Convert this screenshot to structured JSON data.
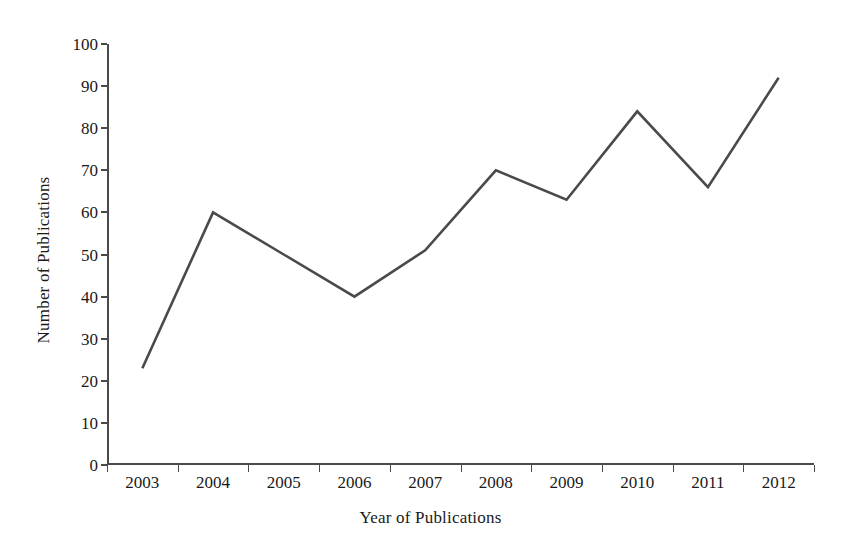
{
  "chart_data": {
    "type": "line",
    "title": "",
    "xlabel": "Year of Publications",
    "ylabel": "Number of Publications",
    "categories": [
      "2003",
      "2004",
      "2005",
      "2006",
      "2007",
      "2008",
      "2009",
      "2010",
      "2011",
      "2012"
    ],
    "values": [
      23,
      60,
      50,
      40,
      51,
      70,
      63,
      84,
      66,
      92
    ],
    "series": [
      {
        "name": "Number of Publications",
        "values": [
          23,
          60,
          50,
          40,
          51,
          70,
          63,
          84,
          66,
          92
        ]
      }
    ],
    "ylim": [
      0,
      100
    ],
    "y_ticks": [
      0,
      10,
      20,
      30,
      40,
      50,
      60,
      70,
      80,
      90,
      100
    ],
    "y_tick_labels": [
      "0",
      "10",
      "20",
      "30",
      "40",
      "50",
      "60",
      "70",
      "80",
      "90",
      "100"
    ],
    "x_tick_labels": [
      "2003",
      "2004",
      "2005",
      "2006",
      "2007",
      "2008",
      "2009",
      "2010",
      "2011",
      "2012"
    ],
    "grid": false,
    "legend": false,
    "legend_position": "none",
    "line_color": "#4a4a4a",
    "axis_color": "#4a4a4a",
    "background_color": "#ffffff",
    "markers": false
  }
}
